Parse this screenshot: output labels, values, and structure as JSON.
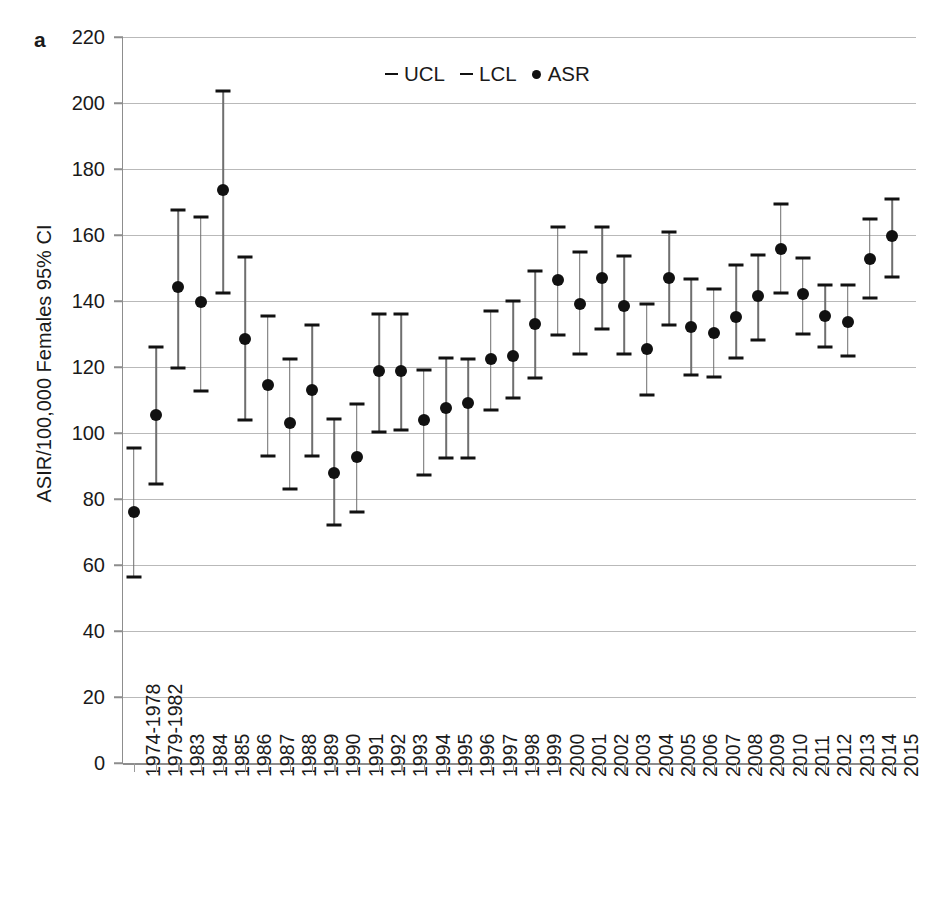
{
  "figure": {
    "panel_letter": "a",
    "ylabel": "ASIR/100,000 Females 95% CI"
  },
  "legend": {
    "items": [
      {
        "symbol": "dash",
        "label": "UCL"
      },
      {
        "symbol": "dash",
        "label": "LCL"
      },
      {
        "symbol": "dot",
        "label": "ASR"
      }
    ]
  },
  "chart_data": {
    "type": "scatter",
    "title": "",
    "xlabel": "",
    "ylabel": "ASIR/100,000 Females 95% CI",
    "ylim": [
      0,
      220
    ],
    "yticks": [
      0,
      20,
      40,
      60,
      80,
      100,
      120,
      140,
      160,
      180,
      200,
      220
    ],
    "grid": true,
    "legend_position": "top-center",
    "error_bars": "95% CI (LCL to UCL)",
    "categories": [
      "1974-1978",
      "1979-1982",
      "1983",
      "1984",
      "1985",
      "1986",
      "1987",
      "1988",
      "1989",
      "1990",
      "1991",
      "1992",
      "1993",
      "1994",
      "1995",
      "1996",
      "1997",
      "1998",
      "1999",
      "2000",
      "2001",
      "2002",
      "2003",
      "2004",
      "2005",
      "2006",
      "2007",
      "2008",
      "2009",
      "2010",
      "2011",
      "2012",
      "2013",
      "2014",
      "2015"
    ],
    "series": [
      {
        "name": "ASR",
        "values": [
          76.0,
          105.6,
          144.3,
          139.7,
          173.6,
          128.6,
          114.5,
          103.0,
          113.0,
          87.8,
          92.6,
          118.9,
          118.9,
          104.0,
          107.6,
          109.0,
          122.5,
          123.3,
          133.0,
          146.4,
          139.2,
          147.0,
          138.6,
          125.4,
          146.9,
          132.1,
          130.2,
          135.3,
          141.5,
          155.7,
          142.0,
          135.6,
          133.6,
          152.7,
          159.8
        ]
      },
      {
        "name": "UCL",
        "values": [
          95.6,
          126.2,
          167.6,
          165.6,
          203.5,
          153.3,
          135.5,
          122.3,
          132.7,
          104.3,
          108.9,
          136.2,
          136.1,
          119.0,
          122.6,
          122.5,
          137.0,
          140.0,
          149.0,
          162.3,
          155.0,
          162.5,
          153.6,
          139.0,
          161.0,
          146.6,
          143.5,
          151.0,
          154.0,
          169.4,
          153.0,
          145.0,
          145.0,
          165.0,
          170.8
        ]
      },
      {
        "name": "LCL",
        "values": [
          56.3,
          84.4,
          119.6,
          112.6,
          142.5,
          104.0,
          93.0,
          83.1,
          93.0,
          72.0,
          76.2,
          100.4,
          101.0,
          87.4,
          92.3,
          92.3,
          107.0,
          110.5,
          116.6,
          129.8,
          123.8,
          131.6,
          124.0,
          111.6,
          132.6,
          117.7,
          117.0,
          122.6,
          128.3,
          142.4,
          130.0,
          126.2,
          123.3,
          141.0,
          147.4
        ]
      }
    ]
  }
}
